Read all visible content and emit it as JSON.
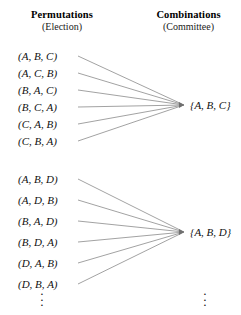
{
  "figure": {
    "kind": "mapping-diagram",
    "width": 241,
    "height": 315,
    "background_color": "#ffffff",
    "line_color": "#8a8a8a",
    "text_color": "#111111"
  },
  "columns": {
    "left": {
      "title": "Permutations",
      "subtitle": "(Election)"
    },
    "right": {
      "title": "Combinations",
      "subtitle": "(Committee)"
    }
  },
  "groups": [
    {
      "id": "group-abc",
      "permutations": [
        "(A, B, C)",
        "(A, C, B)",
        "(B, A, C)",
        "(B, C, A)",
        "(C, A, B)",
        "(C, B, A)"
      ],
      "combination": "{A, B, C}",
      "permutation_count": 6,
      "combination_count": 1
    },
    {
      "id": "group-abd",
      "permutations": [
        "(A, B, D)",
        "(A, D, B)",
        "(B, A, D)",
        "(B, D, A)",
        "(D, A, B)",
        "(D, B, A)"
      ],
      "combination": "{A, B, D}",
      "permutation_count": 6,
      "combination_count": 1
    }
  ],
  "continuation": {
    "left_ellipsis": "⋮",
    "right_ellipsis": "⋮",
    "dot": "·"
  },
  "layout": {
    "perm_x": 18,
    "perm_row_height": 17,
    "group1_first_row_y": 50,
    "group2_first_row_y": 173,
    "line_start_x": 78,
    "group1_focus": {
      "x": 184,
      "y": 105
    },
    "group2_focus": {
      "x": 184,
      "y": 232
    },
    "comb_label_x": 190,
    "comb1_y": 99,
    "comb2_y": 226
  }
}
